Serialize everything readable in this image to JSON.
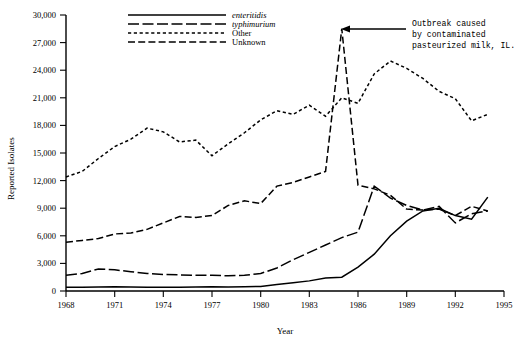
{
  "chart_data": {
    "type": "line",
    "title": "",
    "xlabel": "Year",
    "ylabel": "Reported Isolates",
    "xlim": [
      1968,
      1995
    ],
    "ylim": [
      0,
      30000
    ],
    "grid": false,
    "legend_position": "top-center",
    "x_ticks": [
      "1968",
      "1971",
      "1974",
      "1977",
      "1980",
      "1983",
      "1986",
      "1989",
      "1992",
      "1995"
    ],
    "x_tick_values": [
      1968,
      1971,
      1974,
      1977,
      1980,
      1983,
      1986,
      1989,
      1992,
      1995
    ],
    "y_ticks": [
      "0",
      "3,000",
      "6,000",
      "9,000",
      "12,000",
      "15,000",
      "18,000",
      "21,000",
      "24,000",
      "27,000",
      "30,000"
    ],
    "y_tick_values": [
      0,
      3000,
      6000,
      9000,
      12000,
      15000,
      18000,
      21000,
      24000,
      27000,
      30000
    ],
    "x": [
      1968,
      1969,
      1970,
      1971,
      1972,
      1973,
      1974,
      1975,
      1976,
      1977,
      1978,
      1979,
      1980,
      1981,
      1982,
      1983,
      1984,
      1985,
      1986,
      1987,
      1988,
      1989,
      1990,
      1991,
      1992,
      1993,
      1994
    ],
    "series": [
      {
        "name": "enteritidis",
        "style": "solid",
        "italic": true,
        "values": [
          400,
          420,
          430,
          450,
          430,
          420,
          400,
          420,
          430,
          450,
          430,
          450,
          500,
          700,
          900,
          1100,
          1400,
          1500,
          2600,
          4000,
          6000,
          7600,
          8700,
          9000,
          8200,
          7800,
          10200
        ]
      },
      {
        "name": "typhimurium",
        "style": "long-dash",
        "italic": true,
        "values": [
          1700,
          1900,
          2400,
          2300,
          2100,
          1900,
          1800,
          1750,
          1700,
          1700,
          1650,
          1700,
          1900,
          2500,
          3400,
          4200,
          5000,
          5800,
          6400,
          11400,
          10100,
          9300,
          8800,
          9200,
          7400,
          8400,
          8700
        ]
      },
      {
        "name": "Other",
        "style": "short-dash",
        "italic": false,
        "values": [
          12400,
          13000,
          14400,
          15700,
          16500,
          17700,
          17300,
          16200,
          16400,
          14700,
          16000,
          17200,
          18600,
          19600,
          19200,
          20200,
          19000,
          21000,
          20400,
          23600,
          25000,
          24200,
          23100,
          21700,
          20900,
          18500,
          19200
        ]
      },
      {
        "name": "Unknown",
        "style": "medium-dash",
        "italic": false,
        "values": [
          5300,
          5500,
          5700,
          6200,
          6300,
          6700,
          7400,
          8100,
          8000,
          8200,
          9300,
          9800,
          9500,
          11400,
          11800,
          12400,
          13000,
          28500,
          11500,
          11100,
          10400,
          8900,
          8800,
          8900,
          8200,
          9200,
          8700
        ]
      }
    ],
    "annotations": [
      {
        "id": "outbreak-note",
        "lines": [
          "Outbreak caused",
          "by contaminated",
          "pasteurized milk, IL."
        ],
        "points_to_series": "Unknown",
        "points_to_x": 1985,
        "points_to_y": 28500
      }
    ]
  },
  "legend": {
    "items": [
      {
        "label": "enteritidis",
        "style": "solid"
      },
      {
        "label": "typhimurium",
        "style": "long-dash"
      },
      {
        "label": "Other",
        "style": "short-dash"
      },
      {
        "label": "Unknown",
        "style": "medium-dash"
      }
    ]
  }
}
